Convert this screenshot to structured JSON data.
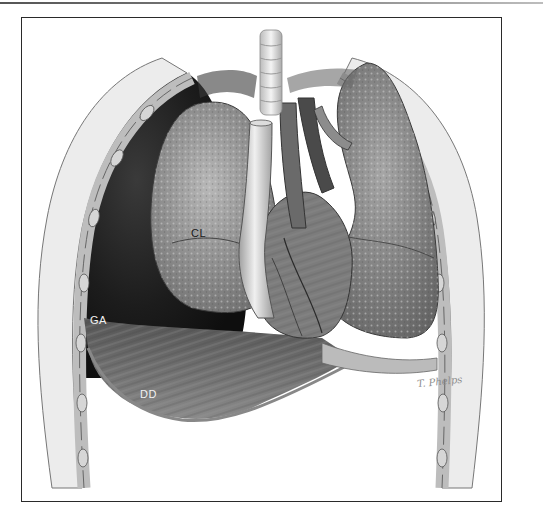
{
  "figure": {
    "type": "medical-illustration",
    "labels": {
      "collapsed_lung": "CL",
      "gas": "GA",
      "diaphragm": "DD"
    },
    "signature": "T. Phelps",
    "colors": {
      "frame": "#2a2a2a",
      "background": "#ffffff",
      "cavity_dark": "#1e1e1e",
      "lung": "#9a9a9a",
      "heart": "#7c7c7c",
      "rib_wall": "#e6e6e6"
    }
  }
}
